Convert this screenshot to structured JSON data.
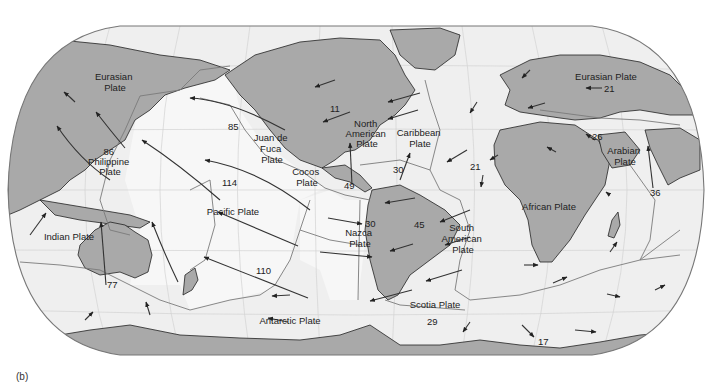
{
  "figure": {
    "panel_label": "(b)"
  },
  "plates": [
    {
      "name": "Eurasian Plate (west)",
      "label": [
        "Eurasian",
        "Plate"
      ]
    },
    {
      "name": "Philippine Plate",
      "label": [
        "86",
        "Philippine",
        "Plate"
      ]
    },
    {
      "name": "Juan de Fuca Plate",
      "label": [
        "Juan de",
        "Fuca",
        "Plate"
      ]
    },
    {
      "name": "North American Plate",
      "label": [
        "North",
        "American",
        "Plate"
      ]
    },
    {
      "name": "Caribbean Plate",
      "label": [
        "Caribbean",
        "Plate"
      ]
    },
    {
      "name": "Cocos Plate",
      "label": [
        "Cocos",
        "Plate"
      ]
    },
    {
      "name": "Pacific Plate",
      "label": [
        "Pacific Plate"
      ]
    },
    {
      "name": "Nazca Plate",
      "label": [
        "Nazca",
        "Plate"
      ]
    },
    {
      "name": "South American Plate",
      "label": [
        "South",
        "American",
        "Plate"
      ]
    },
    {
      "name": "African Plate",
      "label": [
        "African Plate"
      ]
    },
    {
      "name": "Eurasian Plate (east)",
      "label": [
        "Eurasian Plate"
      ]
    },
    {
      "name": "Arabian Plate",
      "label": [
        "Arabian",
        "Plate"
      ]
    },
    {
      "name": "Indian Plate",
      "label": [
        "Indian Plate"
      ]
    },
    {
      "name": "Scotia Plate",
      "label": [
        "Scotia Plate"
      ]
    },
    {
      "name": "Antarctic Plate",
      "label": [
        "Antarctic Plate"
      ]
    }
  ],
  "velocities": [
    {
      "value": "85",
      "plate": "Pacific"
    },
    {
      "value": "114",
      "plate": "Pacific"
    },
    {
      "value": "110",
      "plate": "Pacific"
    },
    {
      "value": "11",
      "plate": "North American"
    },
    {
      "value": "49",
      "plate": "Cocos"
    },
    {
      "value": "30",
      "plate": "Caribbean"
    },
    {
      "value": "30",
      "plate": "Nazca"
    },
    {
      "value": "45",
      "plate": "South American"
    },
    {
      "value": "21",
      "plate": "Atlantic / African"
    },
    {
      "value": "21",
      "plate": "Eurasian"
    },
    {
      "value": "26",
      "plate": "Arabian"
    },
    {
      "value": "36",
      "plate": "Indian"
    },
    {
      "value": "77",
      "plate": "Indian"
    },
    {
      "value": "29",
      "plate": "Scotia"
    },
    {
      "value": "17",
      "plate": "Antarctic"
    }
  ]
}
